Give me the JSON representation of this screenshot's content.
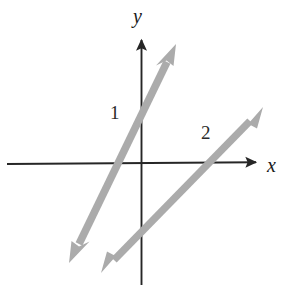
{
  "figure": {
    "width": 286,
    "height": 285,
    "background_color": "#ffffff"
  },
  "axes": {
    "x_axis": {
      "label": "x",
      "color": "#262626",
      "x_start": 7,
      "y_start": 164,
      "x_end": 263,
      "y_end": 162,
      "arrow_end": "right"
    },
    "y_axis": {
      "label": "y",
      "color": "#262626",
      "x_start": 141,
      "y_start": 285,
      "x_end": 141,
      "y_end": 32,
      "arrow_end": "up"
    },
    "origin": {
      "x": 142,
      "y": 162
    }
  },
  "labels": {
    "y_axis_label": "y",
    "x_axis_label": "x",
    "y_intercept_label": "1",
    "x_intercept_label": "2"
  },
  "chart_data": {
    "type": "line",
    "title": "",
    "xlabel": "x",
    "ylabel": "y",
    "grid": false,
    "legend": false,
    "annotations": [
      {
        "text": "1",
        "meaning": "y-intercept of steep line",
        "pixel_x": 117,
        "pixel_y": 112
      },
      {
        "text": "2",
        "meaning": "x-intercept of shallow line",
        "pixel_x": 207,
        "pixel_y": 132
      }
    ],
    "series": [
      {
        "name": "steep-line",
        "color": "#ababab",
        "stroke_width": 7,
        "double_arrow": true,
        "x_intercept_pixel": 124,
        "y_intercept_pixel": 117,
        "points_pixel": [
          {
            "x": 70,
            "y": 262
          },
          {
            "x": 175,
            "y": 45
          }
        ]
      },
      {
        "name": "shallow-line",
        "color": "#ababab",
        "stroke_width": 7,
        "double_arrow": true,
        "x_intercept_pixel": 208,
        "y_intercept_pixel": 247,
        "points_pixel": [
          {
            "x": 102,
            "y": 272
          },
          {
            "x": 262,
            "y": 108
          }
        ]
      }
    ]
  },
  "colors": {
    "line_gray": "#ababab",
    "axis_black": "#262626",
    "text_black": "#1a1a1a",
    "background": "#ffffff"
  }
}
